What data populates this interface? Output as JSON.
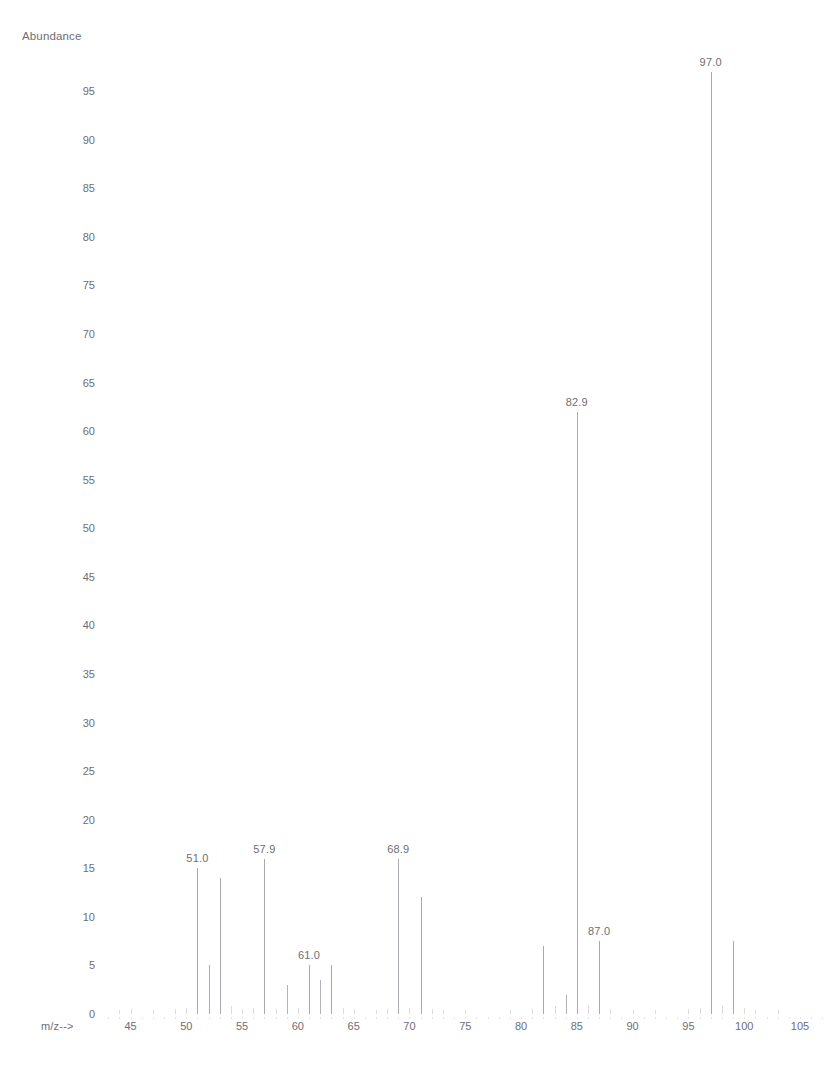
{
  "document": {
    "top_cutoff_text": "",
    "axis_title": "Abundance",
    "mz_caption": "m/z-->"
  },
  "chart_data": {
    "type": "bar",
    "title": "",
    "subtitle": "",
    "xlabel": "m/z-->",
    "ylabel": "Abundance",
    "xlim": [
      42,
      108
    ],
    "ylim": [
      0,
      100
    ],
    "grid": false,
    "legend": null,
    "x_ticks": [
      45,
      50,
      55,
      60,
      65,
      70,
      75,
      80,
      85,
      90,
      95,
      100,
      105
    ],
    "y_ticks": [
      0,
      5,
      10,
      15,
      20,
      25,
      30,
      35,
      40,
      45,
      50,
      55,
      60,
      65,
      70,
      75,
      80,
      85,
      90,
      95
    ],
    "x": [
      44,
      45,
      47,
      49,
      50,
      51,
      52,
      53,
      54,
      55,
      56,
      57,
      58,
      59,
      60,
      61,
      62,
      63,
      64,
      65,
      67,
      68,
      69,
      70,
      71,
      72,
      73,
      75,
      79,
      81,
      82,
      83,
      84,
      85,
      86,
      87,
      88,
      90,
      92,
      95,
      96,
      97,
      98,
      99,
      100,
      101,
      103
    ],
    "values": [
      0.4,
      0.5,
      0.4,
      0.5,
      0.6,
      15.0,
      5.0,
      14.0,
      0.8,
      0.5,
      0.6,
      16.0,
      0.5,
      3.0,
      0.6,
      5.0,
      3.5,
      5.0,
      0.6,
      0.5,
      0.4,
      0.5,
      16.0,
      0.6,
      12.0,
      0.5,
      0.4,
      0.4,
      0.4,
      0.5,
      7.0,
      0.8,
      2.0,
      62.0,
      0.9,
      7.5,
      0.5,
      0.4,
      0.4,
      0.5,
      0.6,
      97.0,
      0.8,
      7.5,
      0.6,
      0.4,
      0.4
    ],
    "annotations": [
      {
        "label": "51.0",
        "mz": 51,
        "value": 15.0
      },
      {
        "label": "57.9",
        "mz": 57,
        "value": 16.0
      },
      {
        "label": "61.0",
        "mz": 61,
        "value": 5.0
      },
      {
        "label": "68.9",
        "mz": 69,
        "value": 16.0
      },
      {
        "label": "82.9",
        "mz": 85,
        "value": 62.0
      },
      {
        "label": "87.0",
        "mz": 87,
        "value": 7.5
      },
      {
        "label": "97.0",
        "mz": 97,
        "value": 97.0
      }
    ]
  },
  "colors": {
    "peak": "#b2b2b8",
    "text": "#6e6e73",
    "background": "#ffffff",
    "tick": "#d2d2d7"
  }
}
